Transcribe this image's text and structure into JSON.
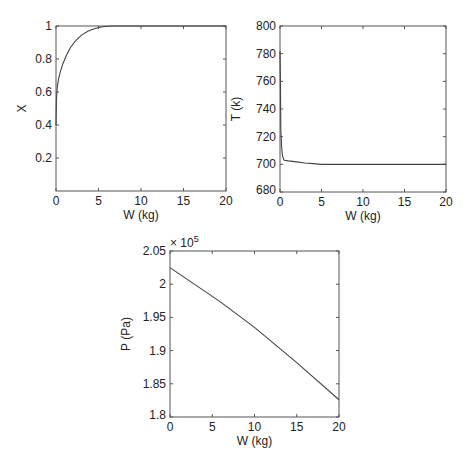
{
  "chart_data": [
    {
      "id": "x-vs-w",
      "type": "line",
      "title": "",
      "xlabel": "W (kg)",
      "ylabel": "X",
      "xlim": [
        0,
        20
      ],
      "ylim": [
        0,
        1
      ],
      "xticks": [
        0,
        5,
        10,
        15,
        20
      ],
      "yticks": [
        0.2,
        0.4,
        0.6,
        0.8,
        1
      ],
      "ytick_labels": [
        "0.2",
        "0.4",
        "0.6",
        "0.8",
        "1"
      ],
      "grid": false,
      "box": {
        "left": 56,
        "top": 26,
        "right": 226,
        "bottom": 191
      },
      "series": [
        {
          "name": "X",
          "x": [
            0,
            0.05,
            0.15,
            0.3,
            0.5,
            0.8,
            1.2,
            1.7,
            2.3,
            3.0,
            3.8,
            4.6,
            5.5,
            6.5,
            8,
            10,
            15,
            20
          ],
          "y": [
            0.4,
            0.55,
            0.63,
            0.68,
            0.72,
            0.77,
            0.82,
            0.87,
            0.91,
            0.945,
            0.97,
            0.985,
            0.995,
            1.0,
            1.0,
            1.0,
            1.0,
            1.0
          ]
        }
      ]
    },
    {
      "id": "t-vs-w",
      "type": "line",
      "title": "",
      "xlabel": "W (kg)",
      "ylabel": "T (k)",
      "xlim": [
        0,
        20
      ],
      "ylim": [
        680,
        800
      ],
      "xticks": [
        0,
        5,
        10,
        15,
        20
      ],
      "yticks": [
        680,
        700,
        720,
        740,
        760,
        780,
        800
      ],
      "ytick_labels": [
        "680",
        "700",
        "720",
        "740",
        "760",
        "780",
        "800"
      ],
      "grid": false,
      "box": {
        "left": 280,
        "top": 26,
        "right": 446,
        "bottom": 192
      },
      "series": [
        {
          "name": "T",
          "x": [
            0,
            0.05,
            0.1,
            0.2,
            0.3,
            0.5,
            1,
            2,
            3,
            4,
            5,
            7,
            10,
            15,
            20
          ],
          "y": [
            782,
            760,
            725,
            712,
            706,
            703,
            702.5,
            701.8,
            701,
            700.5,
            700,
            700,
            700,
            700,
            700
          ]
        }
      ]
    },
    {
      "id": "p-vs-w",
      "type": "line",
      "title": "",
      "xlabel": "W (kg)",
      "ylabel": "P (Pa)",
      "exponent_label": "× 10",
      "exponent_power": "5",
      "xlim": [
        0,
        20
      ],
      "ylim": [
        1.8,
        2.05
      ],
      "xticks": [
        0,
        5,
        10,
        15,
        20
      ],
      "yticks": [
        1.8,
        1.85,
        1.9,
        1.95,
        2.0,
        2.05
      ],
      "ytick_labels": [
        "1.8",
        "1.85",
        "1.9",
        "1.95",
        "2",
        "2.05"
      ],
      "grid": false,
      "box": {
        "left": 170,
        "top": 251,
        "right": 339,
        "bottom": 417
      },
      "series": [
        {
          "name": "P (×10^5)",
          "x": [
            0,
            6,
            10,
            15,
            20
          ],
          "y": [
            2.025,
            1.973,
            1.935,
            1.882,
            1.826
          ]
        }
      ]
    }
  ]
}
